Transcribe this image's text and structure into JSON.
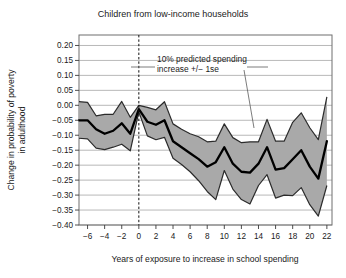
{
  "figure": {
    "title": "Children from low-income households",
    "annotation": {
      "line1": "10% predicted spending",
      "line2": "increase +/− 1se"
    }
  },
  "chart_data": {
    "type": "line",
    "title": "Children from low-income households",
    "xlabel": "Years of exposure to increase in school spending",
    "ylabel": "Change in probability of poverty in adulthood",
    "ylabel_line1": "Change in probability of poverty",
    "ylabel_line2": "in adulthood",
    "grid": true,
    "legend_position": "none",
    "xlim": [
      -7,
      22.6
    ],
    "ylim": [
      -0.4,
      0.235
    ],
    "xticks": [
      -6,
      -4,
      -2,
      0,
      2,
      4,
      6,
      8,
      10,
      12,
      14,
      16,
      18,
      20,
      22
    ],
    "xticklabels": [
      "−6",
      "−4",
      "−2",
      "0",
      "2",
      "4",
      "6",
      "8",
      "10",
      "12",
      "14",
      "16",
      "18",
      "20",
      "22"
    ],
    "yticks": [
      0.2,
      0.15,
      0.1,
      0.05,
      0.0,
      -0.05,
      -0.1,
      -0.15,
      -0.2,
      -0.25,
      -0.3,
      -0.35,
      -0.4
    ],
    "yticklabels": [
      "0.20",
      "0.15",
      "0.10",
      "0.05",
      "0.00",
      "−0.05",
      "−0.10",
      "−0.15",
      "−0.20",
      "−0.25",
      "−0.30",
      "−0.35",
      "−0.40"
    ],
    "reference_line_x": 0,
    "reference_line_style": "dashed",
    "band_color": "#a9a9a9",
    "band_edge_color": "#2a2a2a",
    "line_color": "#000000",
    "grid_color": "#9a9a9a",
    "x": [
      -7,
      -6,
      -5,
      -4,
      -3,
      -2,
      -1,
      0,
      1,
      2,
      3,
      4,
      5,
      6,
      7,
      8,
      9,
      10,
      11,
      12,
      13,
      14,
      15,
      16,
      17,
      18,
      19,
      20,
      21,
      22
    ],
    "series": [
      {
        "name": "10% predicted spending increase",
        "values": [
          -0.05,
          -0.05,
          -0.08,
          -0.095,
          -0.085,
          -0.06,
          -0.095,
          -0.013,
          -0.055,
          -0.065,
          -0.05,
          -0.12,
          -0.14,
          -0.16,
          -0.18,
          -0.205,
          -0.19,
          -0.14,
          -0.195,
          -0.222,
          -0.225,
          -0.195,
          -0.14,
          -0.215,
          -0.21,
          -0.18,
          -0.15,
          -0.205,
          -0.245,
          -0.12
        ]
      },
      {
        "name": "upper +1se",
        "values": [
          0.012,
          0.01,
          -0.035,
          -0.03,
          -0.03,
          0.013,
          -0.04,
          0.0,
          -0.007,
          -0.015,
          0.012,
          -0.062,
          -0.08,
          -0.095,
          -0.105,
          -0.122,
          -0.12,
          -0.062,
          -0.108,
          -0.125,
          -0.122,
          -0.122,
          -0.047,
          -0.12,
          -0.12,
          -0.057,
          -0.025,
          -0.075,
          -0.115,
          0.028
        ]
      },
      {
        "name": "lower −1se",
        "values": [
          -0.11,
          -0.112,
          -0.143,
          -0.148,
          -0.14,
          -0.13,
          -0.152,
          -0.022,
          -0.102,
          -0.115,
          -0.107,
          -0.177,
          -0.198,
          -0.222,
          -0.252,
          -0.288,
          -0.315,
          -0.218,
          -0.28,
          -0.315,
          -0.33,
          -0.268,
          -0.232,
          -0.31,
          -0.3,
          -0.302,
          -0.275,
          -0.332,
          -0.37,
          -0.268
        ]
      }
    ]
  }
}
